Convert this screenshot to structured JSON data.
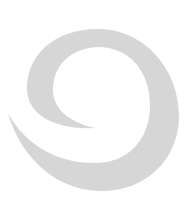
{
  "logo": {
    "icon": "swirl-logo-icon",
    "fill_color": "#d6d6d6",
    "background": "#ffffff"
  }
}
